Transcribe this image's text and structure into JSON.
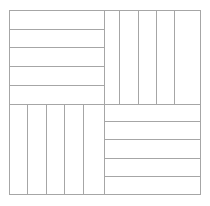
{
  "figure": {
    "background_color": "#ffffff",
    "line_color": "#a6a6a6",
    "border_color": "#a6a6a6",
    "line_width": 1,
    "canvas": {
      "width": 210,
      "height": 206
    }
  },
  "chart_data": {
    "type": "diagram",
    "square": {
      "x0": 9,
      "y0": 10,
      "x1": 200,
      "y1": 194
    },
    "center": {
      "x": 104,
      "y": 104
    },
    "grid": "off",
    "legend": "none",
    "xlabel": "",
    "ylabel": "",
    "quadrants": [
      {
        "name": "top-left",
        "orientation": "horizontal",
        "strip_count": 5,
        "bounds": {
          "x0": 9,
          "y0": 10,
          "x1": 104,
          "y1": 104
        },
        "divider_positions": [
          29,
          47,
          66,
          85
        ]
      },
      {
        "name": "top-right",
        "orientation": "vertical",
        "strip_count": 5,
        "bounds": {
          "x0": 104,
          "y0": 10,
          "x1": 200,
          "y1": 104
        },
        "divider_positions": [
          119,
          138,
          156,
          174
        ]
      },
      {
        "name": "bottom-left",
        "orientation": "vertical",
        "strip_count": 5,
        "bounds": {
          "x0": 9,
          "y0": 104,
          "x1": 104,
          "y1": 194
        },
        "divider_positions": [
          27,
          46,
          64,
          83
        ]
      },
      {
        "name": "bottom-right",
        "orientation": "horizontal",
        "strip_count": 5,
        "bounds": {
          "x0": 104,
          "y0": 104,
          "x1": 200,
          "y1": 194
        },
        "divider_positions": [
          121,
          139,
          158,
          176
        ]
      }
    ],
    "dividers": {
      "vertical_center": {
        "x": 104,
        "y0": 10,
        "y1": 194
      },
      "horizontal_center": {
        "y": 104,
        "x0": 9,
        "x1": 200
      }
    }
  }
}
